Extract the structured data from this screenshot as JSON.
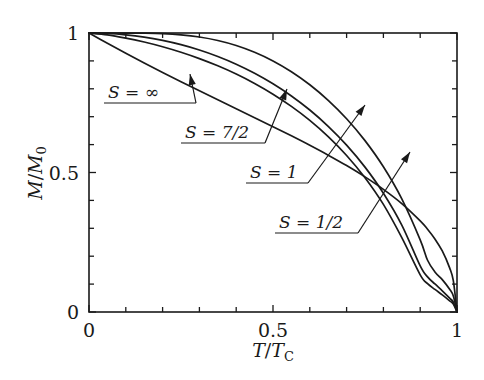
{
  "figure": {
    "background_color": "#ffffff",
    "line_color": "#1a1a1a",
    "width": 484,
    "height": 380
  },
  "chart_data": {
    "type": "line",
    "title": "",
    "subtitle": "",
    "xlabel": "T/T_C",
    "ylabel": "M/M_0",
    "xlabel_parts": {
      "num": "T",
      "den": "T",
      "den_sub": "C"
    },
    "ylabel_parts": {
      "num": "M",
      "den": "M",
      "den_sub": "0"
    },
    "xlim": [
      0,
      1
    ],
    "ylim": [
      0,
      1
    ],
    "grid": false,
    "legend": "inline-annotations",
    "x_ticks_major": [
      0,
      0.5,
      1
    ],
    "x_ticklabels": [
      "0",
      "0.5",
      "1"
    ],
    "x_ticks_minor": [
      0.1,
      0.2,
      0.3,
      0.4,
      0.6,
      0.7,
      0.8,
      0.9
    ],
    "y_ticks_major": [
      0,
      0.5,
      1
    ],
    "y_ticklabels": [
      "0",
      "0.5",
      "1"
    ],
    "y_ticks_minor": [
      0.1,
      0.2,
      0.3,
      0.4,
      0.6,
      0.7,
      0.8,
      0.9
    ],
    "x": [
      0,
      0.05,
      0.1,
      0.15,
      0.2,
      0.25,
      0.3,
      0.35,
      0.4,
      0.45,
      0.5,
      0.55,
      0.6,
      0.65,
      0.7,
      0.75,
      0.8,
      0.85,
      0.9,
      0.92,
      0.94,
      0.96,
      0.98,
      0.99,
      1
    ],
    "series": [
      {
        "name": "S = 1/2",
        "label": "S = 1/2",
        "values": [
          1,
          1,
          0.9999,
          0.9994,
          0.9977,
          0.9934,
          0.9856,
          0.9731,
          0.9551,
          0.9308,
          0.8997,
          0.8611,
          0.8144,
          0.7586,
          0.6926,
          0.6143,
          0.5204,
          0.4054,
          0.2586,
          0.1855,
          0.1435,
          0.1162,
          0.0816,
          0.0575,
          0
        ]
      },
      {
        "name": "S = 1",
        "label": "S = 1",
        "values": [
          1,
          0.9983,
          0.9934,
          0.9852,
          0.9735,
          0.9582,
          0.9391,
          0.9159,
          0.8883,
          0.8559,
          0.8181,
          0.7744,
          0.7239,
          0.6656,
          0.5981,
          0.5192,
          0.4256,
          0.3114,
          0.1652,
          0.126,
          0.1004,
          0.0761,
          0.0498,
          0.0351,
          0
        ]
      },
      {
        "name": "S = 7/2",
        "label": "S = 7/2",
        "values": [
          1,
          0.9935,
          0.9819,
          0.9676,
          0.9507,
          0.931,
          0.9083,
          0.8824,
          0.8529,
          0.8192,
          0.7808,
          0.737,
          0.6867,
          0.6286,
          0.561,
          0.4813,
          0.3856,
          0.2663,
          0.1331,
          0.1016,
          0.0809,
          0.0614,
          0.0402,
          0.0283,
          0
        ]
      },
      {
        "name": "S = infinity",
        "label": "S = ∞",
        "values": [
          1,
          0.9629,
          0.927,
          0.8922,
          0.8583,
          0.8252,
          0.7927,
          0.7606,
          0.7286,
          0.6966,
          0.6643,
          0.6314,
          0.5975,
          0.5622,
          0.5248,
          0.4844,
          0.4397,
          0.3887,
          0.3267,
          0.2967,
          0.2618,
          0.2187,
          0.1581,
          0.1124,
          0
        ]
      }
    ],
    "annotations": [
      {
        "text": "S = ∞",
        "text_x": 108,
        "text_y": 98,
        "underline_x1": 104,
        "underline_x2": 196,
        "underline_y": 103,
        "leader_x1": 196,
        "leader_y1": 103,
        "leader_x2": 190,
        "leader_y2": 74,
        "arrow_angle": -78
      },
      {
        "text": "S = 7/2",
        "text_x": 185,
        "text_y": 138,
        "underline_x1": 181,
        "underline_x2": 265,
        "underline_y": 143,
        "leader_x1": 265,
        "leader_y1": 143,
        "leader_x2": 287,
        "leader_y2": 89,
        "arrow_angle": -68
      },
      {
        "text": "S = 1",
        "text_x": 250,
        "text_y": 178,
        "underline_x1": 246,
        "underline_x2": 308,
        "underline_y": 183,
        "leader_x1": 308,
        "leader_y1": 183,
        "leader_x2": 365,
        "leader_y2": 105,
        "arrow_angle": -54
      },
      {
        "text": "S = 1/2",
        "text_x": 279,
        "text_y": 228,
        "underline_x1": 275,
        "underline_x2": 358,
        "underline_y": 233,
        "leader_x1": 358,
        "leader_y1": 233,
        "leader_x2": 410,
        "leader_y2": 152,
        "arrow_angle": -57
      }
    ]
  },
  "axes_geometry": {
    "left": 89,
    "right": 457,
    "top": 33,
    "bottom": 312,
    "tick_major_len": 7,
    "tick_minor_len": 5
  }
}
